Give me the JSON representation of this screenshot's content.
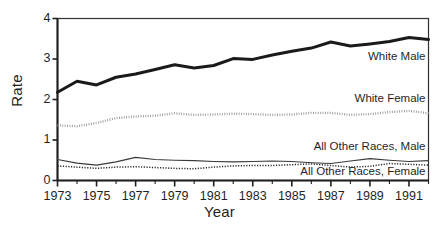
{
  "chart_data": {
    "type": "line",
    "title": "",
    "xlabel": "Year",
    "ylabel": "Rate",
    "xlim": [
      1973,
      1992
    ],
    "ylim": [
      0,
      4
    ],
    "grid": false,
    "legend_position": "inline-right",
    "x": [
      1973,
      1974,
      1975,
      1976,
      1977,
      1978,
      1979,
      1980,
      1981,
      1982,
      1983,
      1984,
      1985,
      1986,
      1987,
      1988,
      1989,
      1990,
      1991,
      1992
    ],
    "xticks": [
      1973,
      1975,
      1977,
      1979,
      1981,
      1983,
      1985,
      1987,
      1989,
      1991
    ],
    "xtick_labels": [
      "1973",
      "1975",
      "1977",
      "1979",
      "1981",
      "1983",
      "1985",
      "1987",
      "1989",
      "1991"
    ],
    "yticks": [
      0,
      1,
      2,
      3,
      4
    ],
    "ytick_labels": [
      "0",
      "1",
      "2",
      "3",
      "4"
    ],
    "series": [
      {
        "name": "White Male",
        "style": "thick-solid",
        "color": "#1a1a1a",
        "values": [
          2.18,
          2.45,
          2.36,
          2.55,
          2.63,
          2.74,
          2.86,
          2.78,
          2.84,
          3.01,
          2.99,
          3.1,
          3.19,
          3.27,
          3.42,
          3.32,
          3.37,
          3.43,
          3.53,
          3.48
        ]
      },
      {
        "name": "White Female",
        "style": "dotted-light",
        "color": "#9a9a9a",
        "values": [
          1.36,
          1.34,
          1.42,
          1.54,
          1.58,
          1.6,
          1.66,
          1.62,
          1.63,
          1.65,
          1.64,
          1.62,
          1.63,
          1.67,
          1.67,
          1.62,
          1.64,
          1.69,
          1.72,
          1.66
        ]
      },
      {
        "name": "All Other Races, Male",
        "style": "thin-solid",
        "color": "#3a3a3a",
        "values": [
          0.52,
          0.43,
          0.38,
          0.46,
          0.57,
          0.52,
          0.5,
          0.49,
          0.47,
          0.46,
          0.47,
          0.48,
          0.47,
          0.44,
          0.42,
          0.48,
          0.54,
          0.5,
          0.47,
          0.49
        ]
      },
      {
        "name": "All Other Races, Female",
        "style": "dotted-fine",
        "color": "#2b2b2b",
        "values": [
          0.36,
          0.33,
          0.3,
          0.33,
          0.34,
          0.32,
          0.3,
          0.29,
          0.33,
          0.36,
          0.37,
          0.37,
          0.39,
          0.41,
          0.37,
          0.33,
          0.35,
          0.42,
          0.4,
          0.38
        ]
      }
    ],
    "annotations": [
      {
        "text": "White Male",
        "x": 1992,
        "y": 3.05
      },
      {
        "text": "White Female",
        "x": 1992,
        "y": 2.02
      },
      {
        "text": "All Other Races, Male",
        "x": 1992,
        "y": 0.82
      },
      {
        "text": "All Other Races, Female",
        "x": 1992,
        "y": 0.2
      }
    ]
  },
  "axes": {
    "ylabel": "Rate",
    "xlabel": "Year"
  }
}
